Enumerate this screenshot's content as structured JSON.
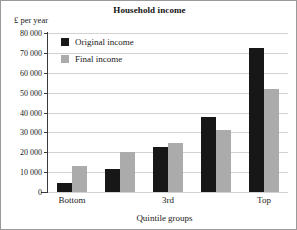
{
  "chart_data": {
    "type": "bar",
    "title": "Household income",
    "xlabel": "Quintile groups",
    "ylabel": "£ per year",
    "categories": [
      "Bottom",
      "2nd",
      "3rd",
      "4th",
      "Top"
    ],
    "visible_tick_labels": [
      "Bottom",
      "",
      "3rd",
      "",
      "Top"
    ],
    "series": [
      {
        "name": "Original income",
        "color": "#171717",
        "values": [
          4500,
          11500,
          22500,
          37500,
          72500
        ]
      },
      {
        "name": "Final income",
        "color": "#ababab",
        "values": [
          13000,
          20000,
          24500,
          31000,
          52000
        ]
      }
    ],
    "ylim": [
      0,
      80000
    ],
    "ytick_values": [
      0,
      10000,
      20000,
      30000,
      40000,
      50000,
      60000,
      70000,
      80000
    ],
    "ytick_labels": [
      "0",
      "10 000",
      "20 000",
      "30 000",
      "40 000",
      "50 000",
      "60 000",
      "70 000",
      "80 000"
    ],
    "grid": "horizontal",
    "legend_position": "inside upper-left",
    "gridline_color": "#d2d2d2",
    "axis_color": "#3a3a3a"
  },
  "legend": {
    "items": [
      {
        "label": "Original income"
      },
      {
        "label": "Final income"
      }
    ]
  }
}
